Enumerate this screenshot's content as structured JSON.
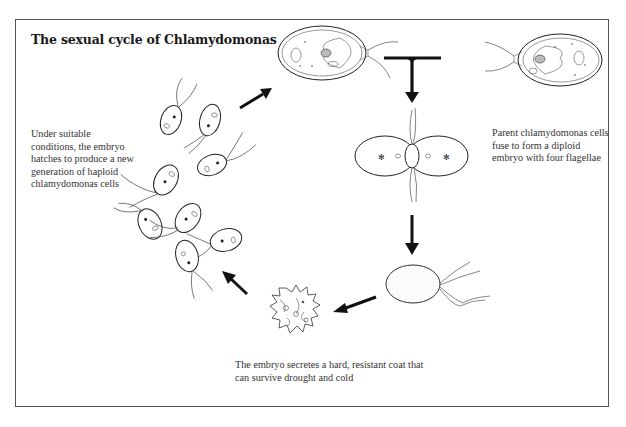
{
  "title": "The sexual cycle of Chlamydomonas",
  "captions": {
    "hatch": "Under suitable conditions, the embryo hatches to produce a new generation of haploid chlamydomonas cells",
    "fuse": "Parent chlamydomonas cells fuse to form a diploid embryo with four flagellae",
    "coat": "The embryo secretes a hard, resistant coat that can survive drought and cold"
  },
  "stages": [
    {
      "id": "parent-cells",
      "label": "Two parent chlamydomonas cells"
    },
    {
      "id": "fusion",
      "label": "Fusing cells (diploid embryo forming)"
    },
    {
      "id": "embryo",
      "label": "Diploid embryo with four flagellae"
    },
    {
      "id": "resistant-coat",
      "label": "Embryo with hard resistant coat"
    },
    {
      "id": "new-generation",
      "label": "New generation of haploid cells"
    }
  ],
  "colors": {
    "frame": "#555555",
    "ink": "#222222",
    "background": "#ffffff"
  }
}
